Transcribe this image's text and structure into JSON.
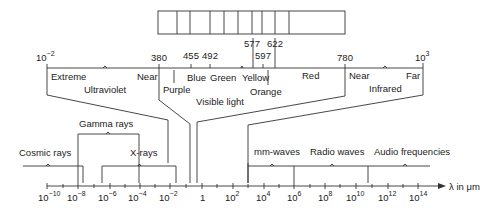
{
  "colors": {
    "line": "#333333",
    "text": "#222222",
    "background": "#ffffff"
  },
  "color_bar": {
    "cells": 11,
    "dividers_x": [
      158,
      177,
      190,
      210,
      224,
      238,
      252,
      262,
      275,
      289,
      345
    ]
  },
  "visible_scale": {
    "ticks": [
      {
        "label": "380",
        "x": 159
      },
      {
        "label": "455",
        "x": 191
      },
      {
        "label": "492",
        "x": 210
      },
      {
        "label": "577",
        "x": 253
      },
      {
        "label": "597",
        "x": 262
      },
      {
        "label": "622",
        "x": 275
      },
      {
        "label": "780",
        "x": 345
      }
    ]
  },
  "upper_axis": {
    "left_label": {
      "base": "10",
      "exp": "−2"
    },
    "right_label": {
      "base": "10",
      "exp": "3"
    }
  },
  "upper_labels": {
    "extreme": "Extreme",
    "near_uv": "Near",
    "ultraviolet": "Ultraviolet",
    "purple": "Purple",
    "blue": "Blue",
    "green": "Green",
    "yellow": "Yellow",
    "orange": "Orange",
    "red": "Red",
    "visible_light": "Visible light",
    "near_ir": "Near",
    "far_ir": "Far",
    "infrared": "Infrared"
  },
  "bands": {
    "cosmic_rays": "Cosmic rays",
    "gamma_rays": "Gamma rays",
    "x_rays": "X-rays",
    "mm_waves": "mm-waves",
    "radio_waves": "Radio waves",
    "audio_frequencies": "Audio frequencies"
  },
  "axis": {
    "unit_label": "λ  in  μm",
    "ticks": [
      {
        "base": "10",
        "exp": "−10",
        "x": 47
      },
      {
        "base": "10",
        "exp": "−8",
        "x": 78
      },
      {
        "base": "10",
        "exp": "−6",
        "x": 110
      },
      {
        "base": "10",
        "exp": "−4",
        "x": 140
      },
      {
        "base": "10",
        "exp": "−2",
        "x": 170
      },
      {
        "base": "1",
        "exp": "",
        "x": 202
      },
      {
        "base": "10",
        "exp": "2",
        "x": 233
      },
      {
        "base": "10",
        "exp": "4",
        "x": 264
      },
      {
        "base": "10",
        "exp": "6",
        "x": 294
      },
      {
        "base": "10",
        "exp": "8",
        "x": 325
      },
      {
        "base": "10",
        "exp": "10",
        "x": 356
      },
      {
        "base": "10",
        "exp": "12",
        "x": 388
      },
      {
        "base": "10",
        "exp": "14",
        "x": 418
      }
    ]
  }
}
